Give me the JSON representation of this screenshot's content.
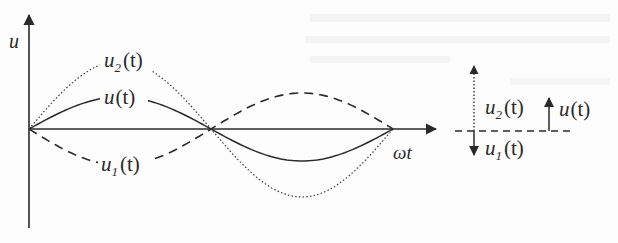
{
  "diagram": {
    "type": "waveform-superposition",
    "colors": {
      "ink": "#2a2a2a",
      "background": "#fdfdfd"
    },
    "axes": {
      "y_label": "u",
      "x_label": "ωt",
      "origin": [
        29,
        129
      ],
      "y_top": 14,
      "y_bottom": 228,
      "x_end": 436
    },
    "curves": [
      {
        "name": "u(t)",
        "style": "solid",
        "amplitude_px": 32,
        "phase": "in-phase",
        "label_main": "u",
        "label_sub": "",
        "label_arg": "(t)"
      },
      {
        "name": "u2(t)",
        "style": "dotted",
        "amplitude_px": 68,
        "phase": "in-phase",
        "label_main": "u",
        "label_sub": "2",
        "label_arg": "(t)"
      },
      {
        "name": "u1(t)",
        "style": "dashed",
        "amplitude_px": 36,
        "phase": "anti-phase",
        "label_main": "u",
        "label_sub": "1",
        "label_arg": "(t)"
      }
    ],
    "period_px": {
      "start_x": 29,
      "half_x": 209,
      "end_x": 393
    },
    "phasor": {
      "baseline_style": "dashed",
      "u2": {
        "label_main": "u",
        "label_sub": "2",
        "label_arg": "(t)",
        "style": "dotted",
        "direction": "up"
      },
      "u1": {
        "label_main": "u",
        "label_sub": "1",
        "label_arg": "(t)",
        "style": "solid",
        "direction": "down"
      },
      "u": {
        "label_main": "u",
        "label_sub": "",
        "label_arg": "(t)",
        "style": "solid",
        "direction": "up"
      }
    }
  }
}
